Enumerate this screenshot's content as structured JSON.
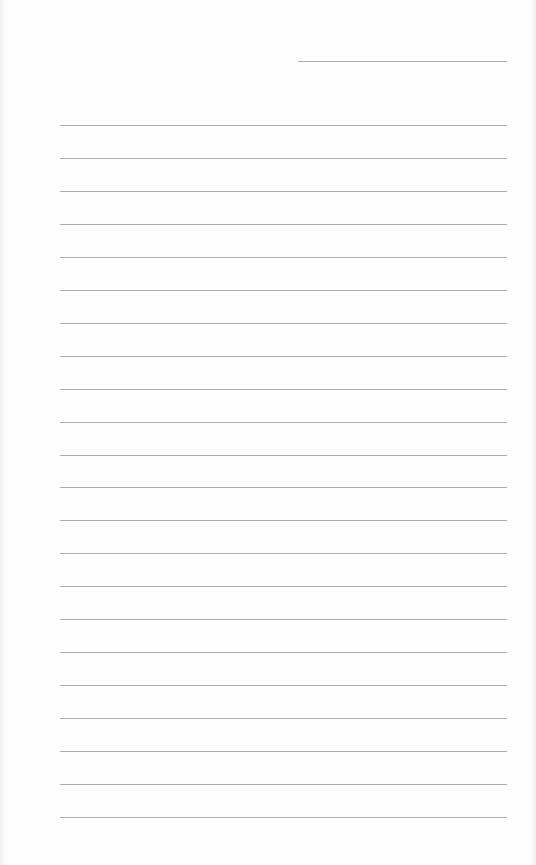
{
  "page": {
    "type": "blank-lined-sheet",
    "background_color": "#ffffff",
    "line_color": "#a3a3a3",
    "header_line": {
      "x_start": 298,
      "x_end": 507,
      "y": 61
    },
    "rules": {
      "count": 22,
      "x_start": 60,
      "x_end": 507,
      "first_y": 125,
      "spacing": 32.95
    }
  }
}
